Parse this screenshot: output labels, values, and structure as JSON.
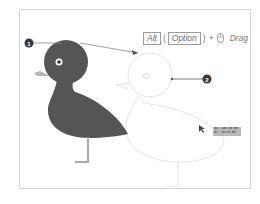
{
  "diagram": {
    "callouts": [
      {
        "number": "1",
        "target": "original-duck"
      },
      {
        "number": "2",
        "target": "duplicate-duck-preview"
      }
    ],
    "shortcut": {
      "key_windows": "Alt",
      "key_mac": "Option",
      "open_paren": "(",
      "close_paren": ")",
      "plus": "+",
      "action": "Drag",
      "mouse_icon": "mouse-icon"
    },
    "tooltip": {
      "line1": "dX: 195.00 mm",
      "line2": "dY: 15.83 mm"
    },
    "colors": {
      "duck_body": "#555555",
      "beak": "#b5b5b5",
      "leg": "#a8a8a8",
      "ghost_outline": "#e2e2e2",
      "callout": "#3a3a3a",
      "frame_border": "#d6d6d6"
    }
  }
}
